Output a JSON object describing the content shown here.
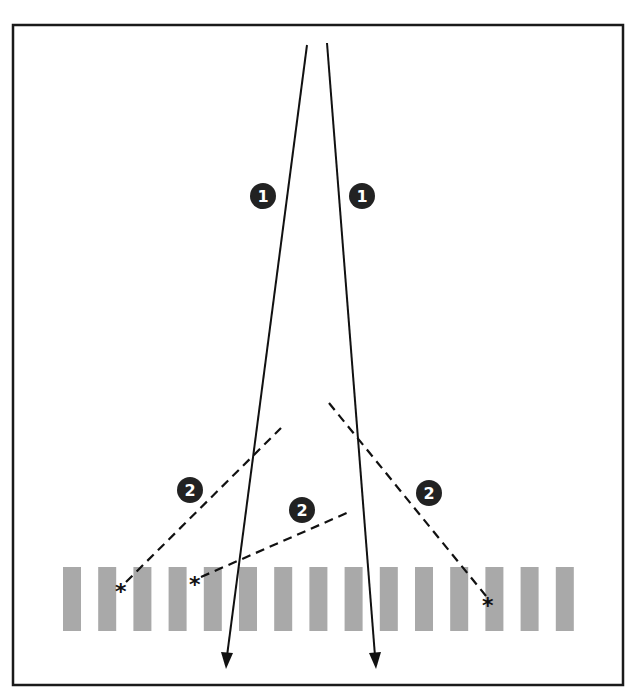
{
  "diagram": {
    "colors": {
      "frame": "#1a1a1a",
      "ray": "#111111",
      "dashed_ray": "#111111",
      "grating_bar": "#a9a9a9",
      "badge_fill": "#222222",
      "badge_text": "#ffffff"
    },
    "grating_bar_count": 15,
    "badges": [
      {
        "id": "ray-1-left",
        "label": "1"
      },
      {
        "id": "ray-1-right",
        "label": "1"
      },
      {
        "id": "scatter-2-left",
        "label": "2"
      },
      {
        "id": "scatter-2-middle",
        "label": "2"
      },
      {
        "id": "scatter-2-right",
        "label": "2"
      }
    ],
    "markers": [
      {
        "id": "scatter-origin-left",
        "symbol": "*"
      },
      {
        "id": "scatter-origin-middle",
        "symbol": "*"
      },
      {
        "id": "scatter-origin-right",
        "symbol": "*"
      }
    ]
  }
}
